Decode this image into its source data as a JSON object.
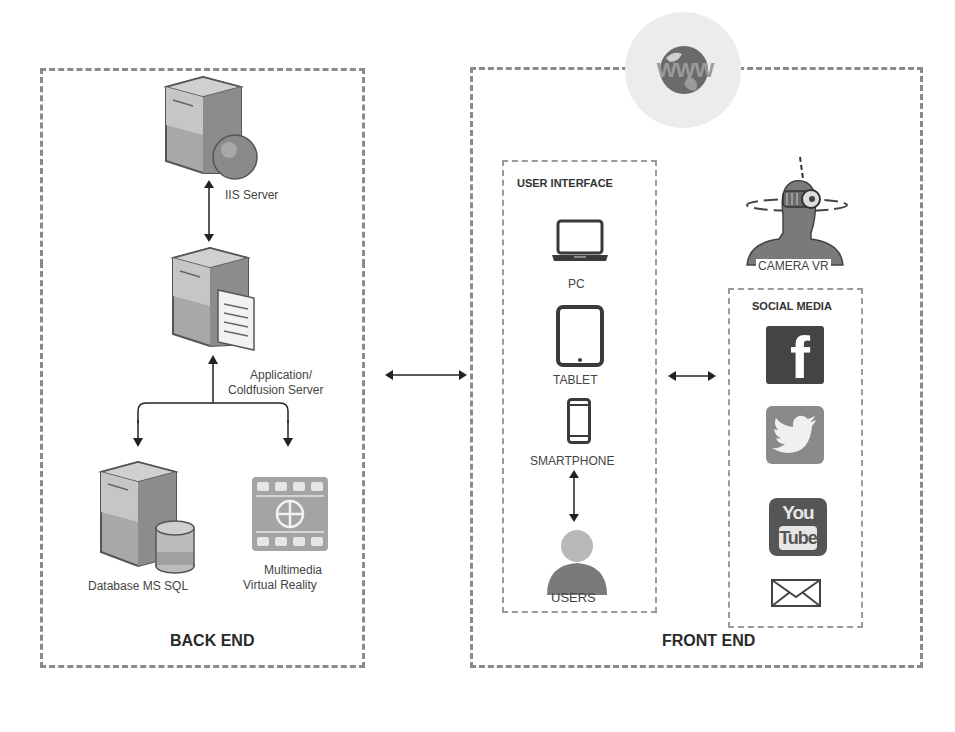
{
  "diagram": {
    "backend": {
      "title": "BACK END",
      "nodes": [
        {
          "id": "iis",
          "label": "IIS Server",
          "icon": "server-globe-icon"
        },
        {
          "id": "app",
          "label_line1": "Application/",
          "label_line2": "Coldfusion Server",
          "icon": "server-document-icon"
        },
        {
          "id": "db",
          "label": "Database MS SQL",
          "icon": "server-database-icon"
        },
        {
          "id": "mm",
          "label_line1": "Multimedia",
          "label_line2": "Virtual Reality",
          "icon": "film-vr-icon"
        }
      ]
    },
    "frontend": {
      "title": "FRONT END",
      "globe_label": "WWW",
      "user_interface": {
        "title": "USER INTERFACE",
        "devices": [
          {
            "label": "PC",
            "icon": "laptop-icon"
          },
          {
            "label": "TABLET",
            "icon": "tablet-icon"
          },
          {
            "label": "SMARTPHONE",
            "icon": "smartphone-icon"
          }
        ],
        "users_label": "USERS"
      },
      "camera_vr": {
        "label": "CAMERA VR",
        "icon": "vr-headset-person-icon"
      },
      "social_media": {
        "title": "SOCIAL MEDIA",
        "items": [
          {
            "name": "Facebook",
            "glyph": "f",
            "icon": "facebook-icon"
          },
          {
            "name": "Twitter",
            "icon": "twitter-icon"
          },
          {
            "name": "YouTube",
            "glyph_top": "You",
            "glyph_bottom": "Tube",
            "icon": "youtube-icon"
          },
          {
            "name": "Email",
            "icon": "email-icon"
          }
        ]
      }
    },
    "colors": {
      "dash": "#8a8a8a",
      "icon_dark": "#555555",
      "icon_mid": "#7d7d7d",
      "icon_light": "#b5b5b5",
      "text": "#333333"
    }
  }
}
